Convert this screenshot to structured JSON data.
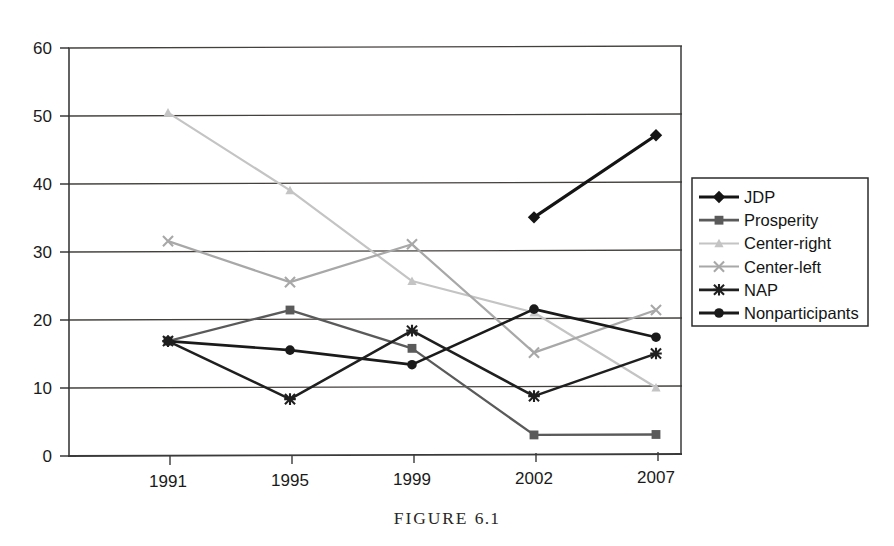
{
  "caption": {
    "label": "FIGURE",
    "number": "6.1",
    "full": "FIGURE 6.1"
  },
  "axes": {
    "y_ticks": [
      "0",
      "10",
      "20",
      "30",
      "40",
      "50",
      "60"
    ],
    "x_ticks": [
      "1991",
      "1995",
      "1999",
      "2002",
      "2007"
    ],
    "y_min": 0,
    "y_max": 60,
    "y_step": 10
  },
  "legend": {
    "items": [
      {
        "label": "JDP",
        "marker": "diamond-marker",
        "color": "#141414"
      },
      {
        "label": "Prosperity",
        "marker": "square-marker",
        "color": "#5a5a5a"
      },
      {
        "label": "Center-right",
        "marker": "triangle-marker",
        "color": "#c4c4c4"
      },
      {
        "label": "Center-left",
        "marker": "cross-x-marker",
        "color": "#a8a8a8"
      },
      {
        "label": "NAP",
        "marker": "asterisk-marker",
        "color": "#1f1f1f"
      },
      {
        "label": "Nonparticipants",
        "marker": "circle-marker",
        "color": "#1a1a1a"
      }
    ]
  },
  "chart_data": {
    "type": "line",
    "title": "",
    "xlabel": "",
    "ylabel": "",
    "ylim": [
      0,
      60
    ],
    "yticks": [
      0,
      10,
      20,
      30,
      40,
      50,
      60
    ],
    "grid": true,
    "legend_position": "right",
    "categories": [
      "1991",
      "1995",
      "1999",
      "2002",
      "2007"
    ],
    "series": [
      {
        "name": "JDP",
        "marker": "diamond",
        "color": "#141414",
        "values": [
          null,
          null,
          null,
          34.9,
          46.9
        ]
      },
      {
        "name": "Prosperity",
        "marker": "square",
        "color": "#5a5a5a",
        "values": [
          16.9,
          21.4,
          15.7,
          2.9,
          2.9
        ]
      },
      {
        "name": "Center-right",
        "marker": "triangle",
        "color": "#c4c4c4",
        "values": [
          50.5,
          39.0,
          25.6,
          20.9,
          9.8
        ]
      },
      {
        "name": "Center-left",
        "marker": "x",
        "color": "#a8a8a8",
        "values": [
          31.6,
          25.5,
          31.0,
          15.0,
          21.2
        ]
      },
      {
        "name": "NAP",
        "marker": "asterisk",
        "color": "#1f1f1f",
        "values": [
          16.9,
          8.3,
          18.3,
          8.6,
          14.8
        ]
      },
      {
        "name": "Nonparticipants",
        "marker": "circle",
        "color": "#1a1a1a",
        "values": [
          16.9,
          15.5,
          13.3,
          21.4,
          17.2
        ]
      }
    ]
  }
}
